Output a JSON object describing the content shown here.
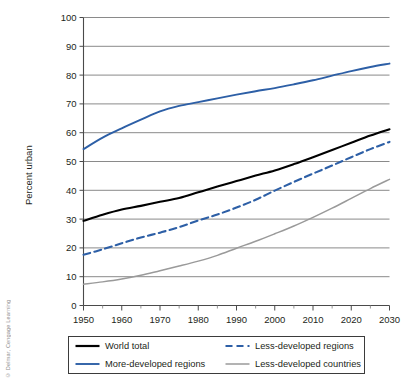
{
  "credit": "© Delmar, Cengage Learning",
  "chart_data": {
    "type": "line",
    "title": "",
    "xlabel": "",
    "ylabel": "Percent urban",
    "xlim": [
      1950,
      2030
    ],
    "ylim": [
      0,
      100
    ],
    "grid": true,
    "legend_position": "bottom",
    "x": [
      1950,
      1955,
      1960,
      1965,
      1970,
      1975,
      1980,
      1985,
      1990,
      1995,
      2000,
      2005,
      2010,
      2015,
      2020,
      2025,
      2030
    ],
    "xticks": [
      1950,
      1960,
      1970,
      1980,
      1990,
      2000,
      2010,
      2020,
      2030
    ],
    "xtick_labels": [
      "1950",
      "1960",
      "1970",
      "1980",
      "1990",
      "2000",
      "2010",
      "2020",
      "2030"
    ],
    "xminor_ticks": [
      1955,
      1965,
      1975,
      1985,
      1995,
      2005,
      2015,
      2025
    ],
    "yticks": [
      0,
      10,
      20,
      30,
      40,
      50,
      60,
      70,
      80,
      90,
      100
    ],
    "ytick_labels": [
      "0",
      "10",
      "20",
      "30",
      "40",
      "50",
      "60",
      "70",
      "80",
      "90",
      "100"
    ],
    "series": [
      {
        "name": "World total",
        "color": "#000000",
        "style": "solid",
        "values": [
          29.4,
          31.5,
          33.3,
          34.6,
          36.0,
          37.3,
          39.3,
          41.3,
          43.2,
          45.1,
          46.9,
          49.1,
          51.5,
          54.0,
          56.5,
          59.0,
          61.2
        ]
      },
      {
        "name": "More-developed regions",
        "color": "#2d5fa6",
        "style": "solid",
        "values": [
          54.3,
          58.3,
          61.5,
          64.5,
          67.4,
          69.3,
          70.6,
          71.9,
          73.2,
          74.4,
          75.5,
          76.8,
          78.2,
          79.8,
          81.4,
          82.8,
          84.0
        ]
      },
      {
        "name": "Less-developed regions",
        "color": "#2d5fa6",
        "style": "dashed",
        "values": [
          17.6,
          19.5,
          21.6,
          23.6,
          25.3,
          27.2,
          29.5,
          31.6,
          34.0,
          36.7,
          39.9,
          42.9,
          45.8,
          48.6,
          51.5,
          54.3,
          56.8
        ]
      },
      {
        "name": "Less-developed countries",
        "color": "#9a9a9a",
        "style": "solid",
        "values": [
          7.4,
          8.2,
          9.2,
          10.5,
          12.1,
          13.7,
          15.4,
          17.4,
          19.9,
          22.3,
          24.9,
          27.6,
          30.6,
          33.8,
          37.2,
          40.6,
          43.8
        ]
      }
    ]
  },
  "legend": {
    "items": [
      {
        "label": "World total",
        "color": "#000000",
        "style": "solid"
      },
      {
        "label": "Less-developed regions",
        "color": "#2d5fa6",
        "style": "dashed"
      },
      {
        "label": "More-developed regions",
        "color": "#2d5fa6",
        "style": "solid"
      },
      {
        "label": "Less-developed countries",
        "color": "#9a9a9a",
        "style": "solid"
      }
    ]
  }
}
